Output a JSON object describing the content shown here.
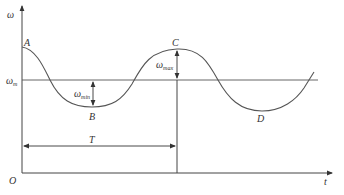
{
  "diagram": {
    "type": "angular-velocity-over-time",
    "axes": {
      "y_label": "ω",
      "x_label": "t",
      "origin_label": "O"
    },
    "reference_line": {
      "label": "ω",
      "label_sub": "m"
    },
    "points": {
      "A": "A",
      "B": "B",
      "C": "C",
      "D": "D"
    },
    "annotations": {
      "omega_min": {
        "main": "ω",
        "sub": "min"
      },
      "omega_max": {
        "main": "ω",
        "sub": "max"
      },
      "period": "T"
    }
  }
}
